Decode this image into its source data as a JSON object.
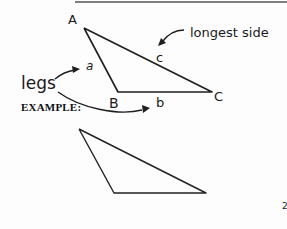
{
  "diagram": {
    "top_triangle": {
      "vertices": {
        "A": "A",
        "B": "B",
        "C": "C"
      },
      "sides": {
        "a": "a",
        "b": "b",
        "c": "c"
      }
    },
    "annotations": {
      "legs_label": "legs",
      "longest_side_label": "longest side"
    },
    "example_label": "EXAMPLE:",
    "bottom_mark": "2"
  }
}
